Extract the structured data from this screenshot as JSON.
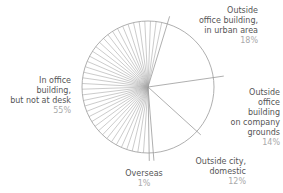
{
  "chart_data": {
    "type": "pie",
    "title": "",
    "start_angle_deg": 17,
    "direction": "clockwise",
    "slices": [
      {
        "label": "Outside office building, in urban area",
        "lines": [
          "Outside",
          "office building,",
          "in urban area"
        ],
        "value": 18,
        "pct_label": "18%"
      },
      {
        "label": "Outside office building on company grounds",
        "lines": [
          "Outside",
          "office",
          "building",
          "on company",
          "grounds"
        ],
        "value": 14,
        "pct_label": "14%"
      },
      {
        "label": "Outside city, domestic",
        "lines": [
          "Outside city,",
          "domestic"
        ],
        "value": 12,
        "pct_label": "12%"
      },
      {
        "label": "Overseas",
        "lines": [
          "Overseas"
        ],
        "value": 1,
        "pct_label": "1%"
      },
      {
        "label": "In office building, but not at desk",
        "lines": [
          "In office",
          "building,",
          "but not at desk"
        ],
        "value": 55,
        "pct_label": "55%",
        "hatched": true
      }
    ],
    "legend": "none (direct labels)"
  },
  "style": {
    "stroke": "#9a9a9a",
    "hatch": "#a8a8a8",
    "label_color": "#555555",
    "pct_color": "#aaaaaa"
  }
}
